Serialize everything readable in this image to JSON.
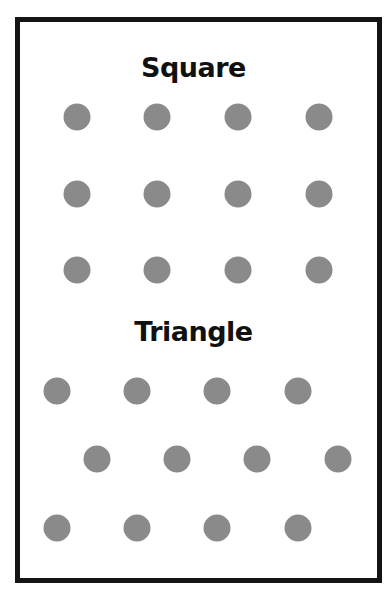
{
  "sections": [
    {
      "title": "Square",
      "title_top": 54,
      "rows": [
        {
          "y": 117,
          "x": [
            77,
            157,
            238,
            319
          ]
        },
        {
          "y": 194,
          "x": [
            77,
            157,
            238,
            319
          ]
        },
        {
          "y": 270,
          "x": [
            77,
            157,
            238,
            319
          ]
        }
      ]
    },
    {
      "title": "Triangle",
      "title_top": 318,
      "rows": [
        {
          "y": 391,
          "x": [
            57,
            137,
            217,
            298
          ]
        },
        {
          "y": 459,
          "x": [
            97,
            177,
            257,
            338
          ]
        },
        {
          "y": 528,
          "x": [
            57,
            137,
            217,
            298
          ]
        }
      ]
    }
  ],
  "colors": {
    "dot": "#8a8a8a",
    "border": "#141414",
    "text": "#111111"
  }
}
